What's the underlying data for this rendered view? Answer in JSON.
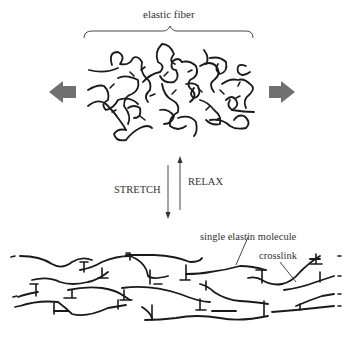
{
  "diagram": {
    "top_label": "elastic fiber",
    "stretch_label": "STRETCH",
    "relax_label": "RELAX",
    "molecule_label": "single elastin molecule",
    "crosslink_label": "crosslink",
    "colors": {
      "arrow_fill": "#707070",
      "line": "#1a1a1a",
      "background": "#ffffff"
    },
    "icons": {
      "left_arrow": "block-arrow-left",
      "right_arrow": "block-arrow-right",
      "stretch_arrow": "arrow-down",
      "relax_arrow": "arrow-up"
    }
  }
}
